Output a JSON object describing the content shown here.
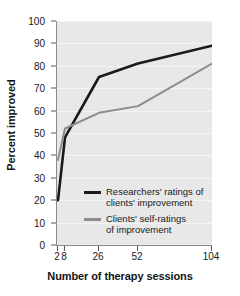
{
  "chart_data": {
    "type": "line",
    "title": "",
    "xlabel": "Number of therapy sessions",
    "ylabel": "Percent improved",
    "x": [
      2,
      8,
      26,
      52,
      104
    ],
    "xtick_labels": [
      "2",
      "8",
      "26",
      "52",
      "104"
    ],
    "ytick_labels": [
      "0",
      "10",
      "20",
      "30",
      "40",
      "50",
      "60",
      "70",
      "80",
      "90",
      "100"
    ],
    "ylim": [
      0,
      100
    ],
    "yticks": [
      0,
      10,
      20,
      30,
      40,
      50,
      60,
      70,
      80,
      90,
      100
    ],
    "grid": true,
    "grid_axis": "y",
    "legend_position": "inside-lower-center",
    "x_scale": "ordinal-nonlinear",
    "series": [
      {
        "name": "Researchers' ratings of clients' improvement",
        "legend_line1": "Researchers' ratings of",
        "legend_line2": "clients' improvement",
        "color": "#1a1a1a",
        "values": [
          20,
          48,
          75,
          81,
          89
        ]
      },
      {
        "name": "Clients' self-ratings of improvement",
        "legend_line1": "Clients' self-ratings",
        "legend_line2": "of improvement",
        "color": "#8c8c8c",
        "values": [
          38,
          52,
          59,
          62,
          81
        ]
      }
    ],
    "colors": {
      "plot_background": "#e8e8e8",
      "gridline": "#f5f5f5",
      "axis": "#8a8a8a",
      "text": "#1a1a1a",
      "figure_background": "#ffffff"
    }
  }
}
